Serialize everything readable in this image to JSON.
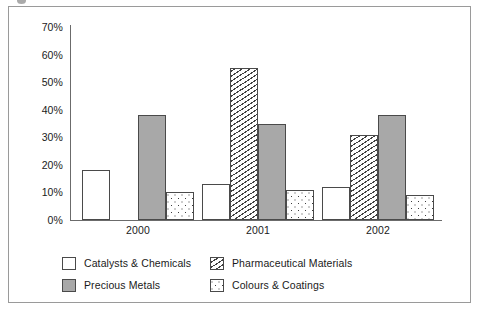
{
  "chart_data": {
    "type": "bar",
    "title": "",
    "subtitle": "",
    "xlabel": "",
    "ylabel": "",
    "categories": [
      "2000",
      "2001",
      "2002"
    ],
    "series": [
      {
        "name": "Catalysts & Chemicals",
        "pattern": "white-outline",
        "values": [
          18,
          13,
          12
        ]
      },
      {
        "name": "Pharmaceutical Materials",
        "pattern": "diagonal-hatch",
        "values": [
          null,
          55,
          31
        ]
      },
      {
        "name": "Precious Metals",
        "pattern": "solid-gray",
        "values": [
          38,
          35,
          38
        ]
      },
      {
        "name": "Colours & Coatings",
        "pattern": "dotted",
        "values": [
          10,
          11,
          9
        ]
      }
    ],
    "ylim": [
      0,
      70
    ],
    "ytick_values": [
      0,
      10,
      20,
      30,
      40,
      50,
      60,
      70
    ],
    "ytick_labels": [
      "0%",
      "10%",
      "20%",
      "30%",
      "40%",
      "50%",
      "60%",
      "70%"
    ],
    "grid": false,
    "legend_position": "bottom",
    "colors": {
      "catalysts_chemicals": "#ffffff",
      "precious_metals": "#a8a8a8",
      "outline": "#4a4a4a",
      "axis": "#6b6b6b",
      "text": "#1a1a1a",
      "frame_border": "#9a9a9a",
      "background": "#ffffff"
    }
  },
  "legend": {
    "items": [
      {
        "label": "Catalysts & Chemicals"
      },
      {
        "label": "Pharmaceutical Materials"
      },
      {
        "label": "Precious Metals"
      },
      {
        "label": "Colours & Coatings"
      }
    ]
  }
}
